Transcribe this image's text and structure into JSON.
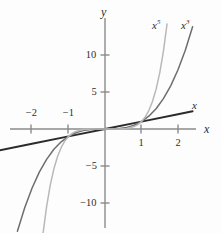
{
  "figure": {
    "background": "#fdfdfd",
    "axis_color": "#8a8a8a",
    "text_color": "#2b2b2b"
  },
  "axes": {
    "y_axis_label": "y",
    "x_axis_label": "x",
    "x_ticks": [
      {
        "value": -2,
        "label": "−2",
        "px": 31,
        "side": "above"
      },
      {
        "value": -1,
        "label": "−1",
        "px": 68,
        "side": "above"
      },
      {
        "value": 1,
        "label": "1",
        "px": 141,
        "side": "below"
      },
      {
        "value": 2,
        "label": "2",
        "px": 178,
        "side": "below"
      }
    ],
    "y_ticks": [
      {
        "value": 10,
        "label": "10",
        "px": 55
      },
      {
        "value": 5,
        "label": "5",
        "px": 92
      },
      {
        "value": -5,
        "label": "−5",
        "px": 166
      },
      {
        "value": -10,
        "label": "−10",
        "px": 203
      }
    ],
    "origin_px": {
      "x": 105,
      "y": 129
    },
    "unit_px": {
      "x": 36.5,
      "y": 7.4
    }
  },
  "curve_labels": [
    {
      "name": "x5",
      "base": "x",
      "exponent": "5",
      "x": 152,
      "y": 20,
      "color": "#b9b9b9"
    },
    {
      "name": "x3",
      "base": "x",
      "exponent": "3",
      "x": 181,
      "y": 20,
      "color": "#6e6e6e"
    },
    {
      "name": "x",
      "base": "x",
      "exponent": "",
      "x": 192,
      "y": 100,
      "color": "#2b2b2b"
    }
  ],
  "chart_data": {
    "type": "line",
    "title": "",
    "xlabel": "x",
    "ylabel": "y",
    "xlim": [
      -2.9,
      3.2
    ],
    "ylim": [
      -14.1,
      10.5
    ],
    "grid": false,
    "legend": "inline-curve-labels",
    "xticks": [
      -2,
      -1,
      1,
      2
    ],
    "yticks": [
      -10,
      -5,
      5,
      10
    ],
    "series": [
      {
        "name": "x",
        "expression": "y = x",
        "color": "#2b2b2b",
        "width": 1.9,
        "x": [
          -2.9,
          -2.0,
          -1.0,
          0.0,
          1.0,
          2.0,
          2.4
        ],
        "values": [
          -2.9,
          -2.0,
          -1.0,
          0.0,
          1.0,
          2.0,
          2.4
        ]
      },
      {
        "name": "x3",
        "expression": "y = x³",
        "color": "#6e6e6e",
        "width": 1.5,
        "x": [
          -2.4,
          -2.2,
          -2.0,
          -1.8,
          -1.6,
          -1.4,
          -1.2,
          -1.0,
          -0.8,
          -0.6,
          -0.4,
          -0.2,
          0.0,
          0.2,
          0.4,
          0.6,
          0.8,
          1.0,
          1.2,
          1.4,
          1.6,
          1.8,
          2.0,
          2.2,
          2.4
        ],
        "values": [
          -13.82,
          -10.65,
          -8.0,
          -5.83,
          -4.1,
          -2.74,
          -1.73,
          -1.0,
          -0.51,
          -0.22,
          -0.06,
          -0.01,
          0.0,
          0.01,
          0.06,
          0.22,
          0.51,
          1.0,
          1.73,
          2.74,
          4.1,
          5.83,
          8.0,
          10.65,
          13.82
        ]
      },
      {
        "name": "x5",
        "expression": "y = x⁵",
        "color": "#b9b9b9",
        "width": 1.5,
        "x": [
          -1.7,
          -1.6,
          -1.5,
          -1.4,
          -1.3,
          -1.2,
          -1.1,
          -1.0,
          -0.9,
          -0.8,
          -0.6,
          -0.4,
          -0.2,
          0.0,
          0.2,
          0.4,
          0.6,
          0.8,
          0.9,
          1.0,
          1.1,
          1.2,
          1.3,
          1.4,
          1.5,
          1.6,
          1.7
        ],
        "values": [
          -14.2,
          -10.49,
          -7.59,
          -5.38,
          -3.71,
          -2.49,
          -1.61,
          -1.0,
          -0.59,
          -0.33,
          -0.08,
          -0.01,
          0.0,
          0.0,
          0.0,
          0.01,
          0.08,
          0.33,
          0.59,
          1.0,
          1.61,
          2.49,
          3.71,
          5.38,
          7.59,
          10.49,
          14.2
        ]
      }
    ]
  }
}
